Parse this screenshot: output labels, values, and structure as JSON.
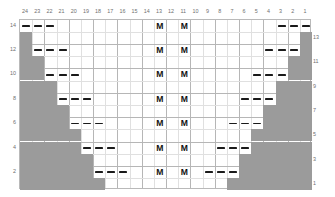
{
  "chart_data": {
    "type": "table",
    "title": "",
    "xlabel": "",
    "ylabel": "",
    "columns": 24,
    "rows": 14,
    "column_labels": [
      "24",
      "23",
      "22",
      "21",
      "20",
      "19",
      "18",
      "17",
      "16",
      "15",
      "14",
      "13",
      "12",
      "11",
      "10",
      "9",
      "8",
      "7",
      "6",
      "5",
      "4",
      "3",
      "2",
      "1"
    ],
    "row_labels_left": [
      "14",
      "12",
      "10",
      "8",
      "6",
      "4",
      "2"
    ],
    "row_labels_right": [
      "13",
      "11",
      "9",
      "7",
      "5",
      "3",
      "1"
    ],
    "legend": [],
    "symbols": {
      "dash": "dash",
      "m": "M",
      "filled": "no-stitch"
    },
    "grid": true,
    "filled_cells": [
      {
        "row": 13,
        "col_start": 24,
        "col_end": 24
      },
      {
        "row": 12,
        "col_start": 24,
        "col_end": 24
      },
      {
        "row": 11,
        "col_start": 24,
        "col_end": 23
      },
      {
        "row": 10,
        "col_start": 24,
        "col_end": 23
      },
      {
        "row": 9,
        "col_start": 24,
        "col_end": 22
      },
      {
        "row": 8,
        "col_start": 24,
        "col_end": 22
      },
      {
        "row": 7,
        "col_start": 24,
        "col_end": 21
      },
      {
        "row": 6,
        "col_start": 24,
        "col_end": 21
      },
      {
        "row": 5,
        "col_start": 24,
        "col_end": 20
      },
      {
        "row": 4,
        "col_start": 24,
        "col_end": 20
      },
      {
        "row": 3,
        "col_start": 24,
        "col_end": 19
      },
      {
        "row": 2,
        "col_start": 24,
        "col_end": 19
      },
      {
        "row": 1,
        "col_start": 24,
        "col_end": 18
      },
      {
        "row": 13,
        "col_start": 1,
        "col_end": 1
      },
      {
        "row": 12,
        "col_start": 1,
        "col_end": 1
      },
      {
        "row": 11,
        "col_start": 2,
        "col_end": 1
      },
      {
        "row": 10,
        "col_start": 2,
        "col_end": 1
      },
      {
        "row": 9,
        "col_start": 3,
        "col_end": 1
      },
      {
        "row": 8,
        "col_start": 3,
        "col_end": 1
      },
      {
        "row": 7,
        "col_start": 4,
        "col_end": 1
      },
      {
        "row": 6,
        "col_start": 4,
        "col_end": 1
      },
      {
        "row": 5,
        "col_start": 5,
        "col_end": 1
      },
      {
        "row": 4,
        "col_start": 5,
        "col_end": 1
      },
      {
        "row": 3,
        "col_start": 6,
        "col_end": 1
      },
      {
        "row": 2,
        "col_start": 6,
        "col_end": 1
      },
      {
        "row": 1,
        "col_start": 7,
        "col_end": 1
      }
    ],
    "dash_cells": [
      {
        "row": 14,
        "cols": [
          24,
          23,
          22
        ]
      },
      {
        "row": 12,
        "cols": [
          23,
          22,
          21
        ]
      },
      {
        "row": 10,
        "cols": [
          22,
          21,
          20
        ]
      },
      {
        "row": 8,
        "cols": [
          21,
          20,
          19
        ]
      },
      {
        "row": 6,
        "cols": [
          20,
          19,
          18
        ]
      },
      {
        "row": 4,
        "cols": [
          19,
          18,
          17
        ]
      },
      {
        "row": 2,
        "cols": [
          18,
          17,
          16
        ]
      },
      {
        "row": 14,
        "cols": [
          3,
          2,
          1
        ]
      },
      {
        "row": 12,
        "cols": [
          4,
          3,
          2
        ]
      },
      {
        "row": 10,
        "cols": [
          5,
          4,
          3
        ]
      },
      {
        "row": 8,
        "cols": [
          6,
          5,
          4
        ]
      },
      {
        "row": 6,
        "cols": [
          7,
          6,
          5
        ]
      },
      {
        "row": 4,
        "cols": [
          8,
          7,
          6
        ]
      },
      {
        "row": 2,
        "cols": [
          9,
          8,
          7
        ]
      }
    ],
    "m_cells": [
      {
        "row": 14,
        "cols": [
          13,
          11
        ]
      },
      {
        "row": 12,
        "cols": [
          13,
          11
        ]
      },
      {
        "row": 10,
        "cols": [
          13,
          11
        ]
      },
      {
        "row": 8,
        "cols": [
          13,
          11
        ]
      },
      {
        "row": 6,
        "cols": [
          13,
          11
        ]
      },
      {
        "row": 4,
        "cols": [
          13,
          11
        ]
      },
      {
        "row": 2,
        "cols": [
          13,
          11
        ]
      }
    ]
  },
  "colors": {
    "fill": "#9b9b9b",
    "grid_minor": "#e0e0e0",
    "grid_major": "#b6b6b6",
    "border": "#b9b9b9",
    "dash": "#1a1a1a",
    "label": "#6f6f6f",
    "symbol": "#111111",
    "background": "#ffffff"
  }
}
